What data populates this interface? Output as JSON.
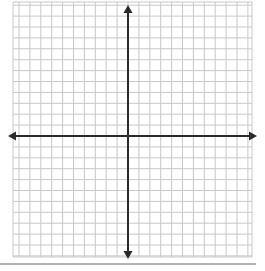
{
  "diagram": {
    "type": "coordinate-plane",
    "grid": {
      "x_start": 13,
      "x_end": 252,
      "y_start": 2,
      "y_end": 257,
      "spacing": 10.9,
      "line_color": "#c8c8c8"
    },
    "axes": {
      "color": "#2a2a2a",
      "x_axis": {
        "y": 136,
        "x_from": 8,
        "x_to": 257,
        "arrows": [
          "left",
          "right"
        ]
      },
      "y_axis": {
        "x": 128,
        "y_from": 5,
        "y_to": 259,
        "arrows": [
          "up",
          "down"
        ]
      }
    },
    "baseline": {
      "y": 264,
      "x_from": 0,
      "x_to": 256,
      "color": "#9a9a9a"
    }
  }
}
